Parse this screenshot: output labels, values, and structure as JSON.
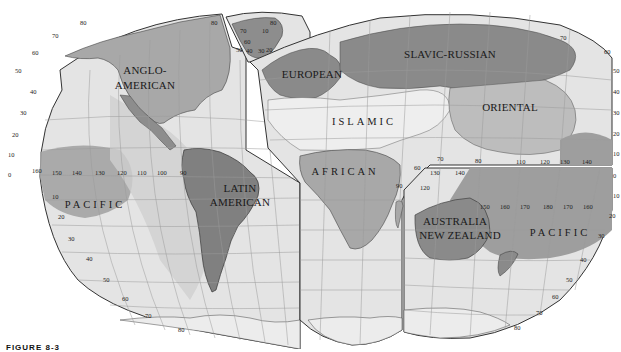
{
  "map": {
    "title": "World culture realms",
    "caption": "FIGURE 8-3",
    "regions": [
      {
        "id": "anglo-american",
        "lines": [
          "ANGLO-",
          "AMERICAN"
        ]
      },
      {
        "id": "latin-american",
        "lines": [
          "LATIN",
          "AMERICAN"
        ]
      },
      {
        "id": "european",
        "lines": [
          "EUROPEAN"
        ]
      },
      {
        "id": "slavic-russian",
        "lines": [
          "SLAVIC-RUSSIAN"
        ]
      },
      {
        "id": "islamic",
        "lines": [
          "ISLAMIC"
        ]
      },
      {
        "id": "african",
        "lines": [
          "AFRICAN"
        ]
      },
      {
        "id": "oriental",
        "lines": [
          "ORIENTAL"
        ]
      },
      {
        "id": "australia-new-zealand",
        "lines": [
          "AUSTRALIA",
          "NEW ZEALAND"
        ]
      },
      {
        "id": "pacific-west",
        "lines": [
          "PACIFIC"
        ]
      },
      {
        "id": "pacific-east",
        "lines": [
          "PACIFIC"
        ]
      }
    ],
    "latitude_ticks_left": [
      "80",
      "70",
      "60",
      "50",
      "40",
      "30",
      "20",
      "10",
      "0",
      "10",
      "20",
      "30",
      "40",
      "50",
      "60",
      "70",
      "80"
    ],
    "latitude_ticks_right": [
      "70",
      "60",
      "50",
      "40",
      "30",
      "20",
      "10",
      "0",
      "10",
      "20",
      "30",
      "40",
      "50",
      "60",
      "70",
      "80"
    ],
    "longitude_ticks_americas": [
      "160",
      "150",
      "140",
      "130",
      "120",
      "110",
      "100",
      "90"
    ],
    "longitude_ticks_asia": [
      "110",
      "120",
      "130",
      "140"
    ],
    "longitude_ticks_oceania": [
      "60",
      "70",
      "80",
      "90",
      "120",
      "130",
      "140",
      "150",
      "160",
      "170",
      "180",
      "170",
      "160"
    ],
    "inset_ticks": [
      "80",
      "70",
      "60",
      "50",
      "40",
      "30",
      "20",
      "10",
      "80"
    ],
    "colors": {
      "ocean": "#e6e6e6",
      "land_light": "#d2d2d2",
      "realm_dark": "#8c8c8c",
      "realm_medium": "#a8a8a8",
      "realm_islamic": "#ececec",
      "pacific_band": "#9e9e9e",
      "grid": "#9a9a9a",
      "border": "#555555"
    }
  }
}
